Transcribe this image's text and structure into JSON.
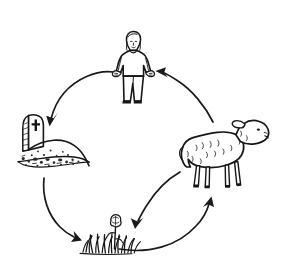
{
  "figure": {
    "title": "Life cycle / cycle of matter hand-drawn diagram",
    "background_color": "#ffffff",
    "ink_color": "#171717",
    "arrow_color": "#1a1a1a",
    "width": 291,
    "height": 269,
    "style": "hand-drawn black ink line art, no text labels"
  },
  "nodes": [
    {
      "id": "human",
      "name": "human-figure",
      "label": "Person standing with arms outstretched",
      "icon": "person-icon",
      "position": "top-center",
      "x": 133,
      "y": 68
    },
    {
      "id": "sheep",
      "name": "sheep-figure",
      "label": "Sheep facing right",
      "icon": "sheep-icon",
      "position": "right",
      "x": 228,
      "y": 152
    },
    {
      "id": "grass",
      "name": "grass-flower-figure",
      "label": "Tuft of grass with a flower",
      "icon": "flower-grass-icon",
      "position": "bottom-center",
      "x": 110,
      "y": 232
    },
    {
      "id": "grave",
      "name": "grave-figure",
      "label": "Gravestone with cross above a soil mound",
      "icon": "gravestone-icon",
      "position": "left",
      "x": 52,
      "y": 150
    }
  ],
  "arrows": [
    {
      "id": "human-to-grave",
      "name": "arrow-human-to-grave",
      "from": "human",
      "to": "grave",
      "direction": "counter-clockwise",
      "label": "Person dies and is buried"
    },
    {
      "id": "grave-to-grass",
      "name": "arrow-grave-to-grass",
      "from": "grave",
      "to": "grass",
      "direction": "counter-clockwise",
      "label": "Remains decompose and nourish plants"
    },
    {
      "id": "grass-to-sheep",
      "name": "arrow-grass-to-sheep",
      "from": "grass",
      "to": "sheep",
      "direction": "counter-clockwise",
      "label": "Sheep eats the plants"
    },
    {
      "id": "sheep-to-human",
      "name": "arrow-sheep-to-human",
      "from": "sheep",
      "to": "human",
      "direction": "counter-clockwise",
      "label": "Person eats the sheep"
    },
    {
      "id": "sheep-to-grass",
      "name": "arrow-sheep-to-grass",
      "from": "sheep",
      "to": "grass",
      "direction": "inward",
      "label": "Sheep droppings fertilise the plants"
    }
  ],
  "chart_data": {
    "type": "diagram",
    "nodes": [
      "human",
      "grave",
      "grass",
      "sheep"
    ],
    "edges": [
      [
        "human",
        "grave"
      ],
      [
        "grave",
        "grass"
      ],
      [
        "grass",
        "sheep"
      ],
      [
        "sheep",
        "human"
      ],
      [
        "sheep",
        "grass"
      ]
    ],
    "legend": []
  }
}
